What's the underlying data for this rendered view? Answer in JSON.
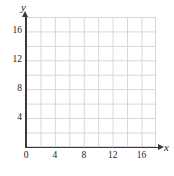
{
  "figure": {
    "axis_names": {
      "x": "x",
      "y": "y"
    },
    "colors": {
      "axis": "#3a3a3a",
      "grid": "#d6d6d6",
      "background": "#ffffff",
      "text": "#1c1c1c"
    }
  },
  "chart_data": {
    "type": "scatter",
    "title": "",
    "xlabel": "x",
    "ylabel": "y",
    "xlim": [
      0,
      18
    ],
    "ylim": [
      0,
      18
    ],
    "xticks": [
      0,
      4,
      8,
      12,
      16
    ],
    "xticklabels": [
      "0",
      "4",
      "8",
      "12",
      "16"
    ],
    "yticks": [
      4,
      8,
      12,
      16
    ],
    "yticklabels": [
      "16",
      "12",
      "8",
      "4"
    ],
    "grid": true,
    "grid_step": 2,
    "legend": null,
    "series": [],
    "values": [],
    "annotations": [],
    "note": "Empty coordinate grid with no plotted data points"
  }
}
